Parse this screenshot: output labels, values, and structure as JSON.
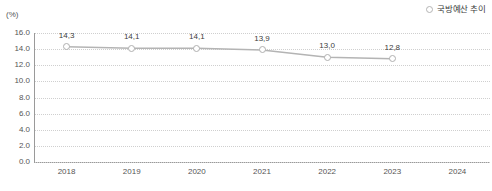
{
  "legend": {
    "marker_icon": "open-circle-icon",
    "label": "국방예산 추이",
    "position": "top-right"
  },
  "axis": {
    "unit_label": "(%)"
  },
  "colors": {
    "line": "#b4b4b4",
    "marker_stroke": "#b0b0b0",
    "marker_fill": "#ffffff",
    "gridline": "#cfcfcf",
    "axis": "#9a9a9a",
    "text": "#555555",
    "label_text": "#3c3c3c",
    "background": "#ffffff"
  },
  "chart_data": {
    "type": "line",
    "title": "",
    "subtitle": "",
    "xlabel": "",
    "ylabel": "(%)",
    "categories": [
      "2018",
      "2019",
      "2020",
      "2021",
      "2022",
      "2023",
      "2024"
    ],
    "values": [
      14.3,
      14.1,
      14.1,
      13.9,
      13.0,
      12.8,
      null
    ],
    "point_labels": [
      "14,3",
      "14,1",
      "14,1",
      "13,9",
      "13,0",
      "12,8",
      ""
    ],
    "series": [
      {
        "name": "국방예산 추이",
        "values": [
          14.3,
          14.1,
          14.1,
          13.9,
          13.0,
          12.8,
          null
        ],
        "labels": [
          "14,3",
          "14,1",
          "14,1",
          "13,9",
          "13,0",
          "12,8",
          ""
        ]
      }
    ],
    "ylim": [
      0.0,
      16.0
    ],
    "ytick_step": 2.0,
    "ytick_labels": [
      "16.0",
      "14.0",
      "12.0",
      "10.0",
      "8.0",
      "6.0",
      "4.0",
      "2.0",
      "0.0"
    ],
    "ytick_values": [
      16.0,
      14.0,
      12.0,
      10.0,
      8.0,
      6.0,
      4.0,
      2.0,
      0.0
    ],
    "xtick_labels": [
      "2018",
      "2019",
      "2020",
      "2021",
      "2022",
      "2023",
      "2024"
    ],
    "grid": true,
    "grid_style": "dotted-horizontal",
    "legend_position": "top-right",
    "decimal_separator": ","
  }
}
